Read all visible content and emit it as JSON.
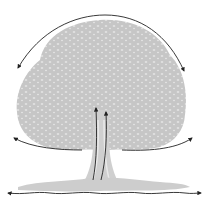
{
  "diagram": {
    "colors": {
      "tree": "#c4c4c4",
      "tree_light": "#dadada",
      "arrows": "#222222",
      "background": "#ffffff"
    },
    "arrows": [
      {
        "name": "canopy-arc-arrow",
        "direction": "both",
        "shape": "arc over crown"
      },
      {
        "name": "left-branch-arrow",
        "direction": "outward-left"
      },
      {
        "name": "right-branch-arrow",
        "direction": "outward-right"
      },
      {
        "name": "trunk-up-arrow-left",
        "direction": "up"
      },
      {
        "name": "trunk-up-arrow-right",
        "direction": "up"
      },
      {
        "name": "ground-arrow",
        "direction": "both",
        "shape": "wavy horizontal"
      }
    ]
  }
}
